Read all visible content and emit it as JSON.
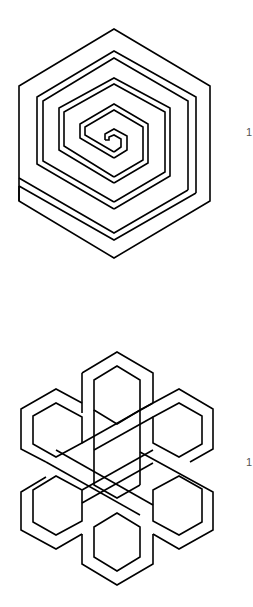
{
  "figures": [
    {
      "id": "hexagonal-spiral",
      "label": "1",
      "stroke_color": "#000000"
    },
    {
      "id": "six-hexagon-interlace",
      "label": "1",
      "stroke_color": "#000000"
    }
  ],
  "colors": {
    "background": "#ffffff",
    "line": "#000000",
    "label": "#555555"
  }
}
